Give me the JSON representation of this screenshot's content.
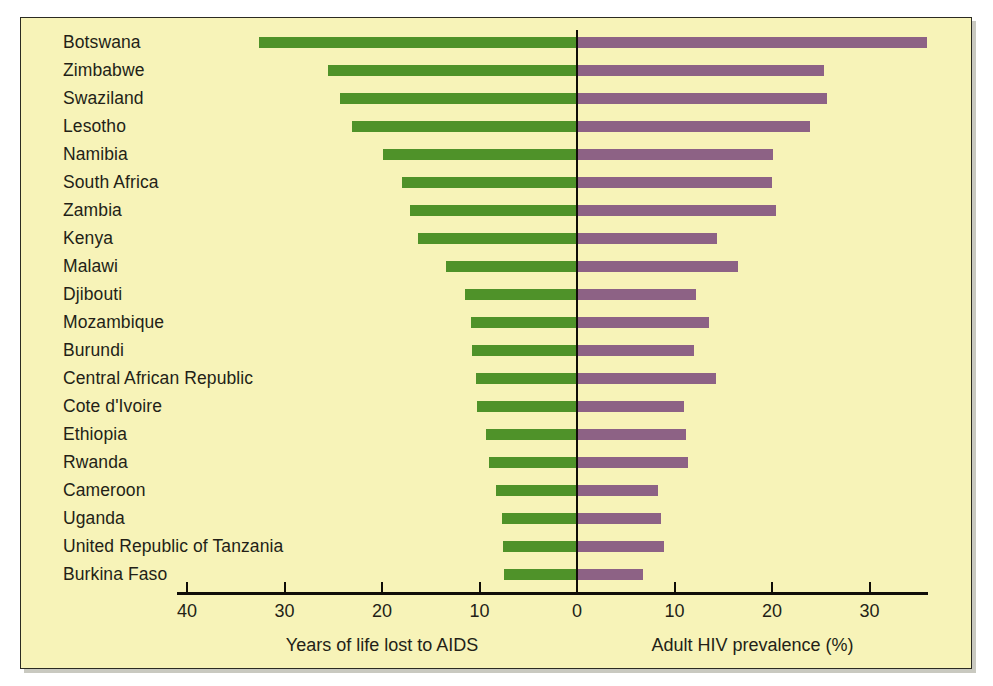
{
  "chart_data": {
    "type": "bar",
    "orientation": "horizontal",
    "style": "diverging-pyramid",
    "title": "",
    "subtitle": "",
    "categories": [
      "Botswana",
      "Zimbabwe",
      "Swaziland",
      "Lesotho",
      "Namibia",
      "South Africa",
      "Zambia",
      "Kenya",
      "Malawi",
      "Djibouti",
      "Mozambique",
      "Burundi",
      "Central African Republic",
      "Cote d'Ivoire",
      "Ethiopia",
      "Rwanda",
      "Cameroon",
      "Uganda",
      "United Republic of Tanzania",
      "Burkina Faso"
    ],
    "series": [
      {
        "name": "Years of life lost to AIDS",
        "side": "left",
        "color": "#4f9229",
        "axis_label": "Years of life lost to AIDS",
        "units": "years",
        "values": [
          32.6,
          25.5,
          24.3,
          23.1,
          19.9,
          17.9,
          17.1,
          16.3,
          13.4,
          11.5,
          10.9,
          10.8,
          10.4,
          10.3,
          9.3,
          9.0,
          8.3,
          7.7,
          7.6,
          7.5
        ]
      },
      {
        "name": "Adult HIV prevalence (%)",
        "side": "right",
        "color": "#8d6285",
        "axis_label": "Adult HIV prevalence (%)",
        "units": "%",
        "values": [
          35.9,
          25.3,
          25.6,
          23.9,
          20.1,
          20.0,
          20.4,
          14.4,
          16.5,
          12.2,
          13.5,
          12.0,
          14.3,
          11.0,
          11.2,
          11.4,
          8.3,
          8.6,
          8.9,
          6.8
        ]
      }
    ],
    "axis": {
      "left_ticks": [
        40,
        30,
        20,
        10
      ],
      "center_tick": 0,
      "right_ticks": [
        10,
        20,
        30
      ],
      "tick_labels": [
        "40",
        "30",
        "20",
        "10",
        "0",
        "10",
        "20",
        "30"
      ],
      "left_max": 40,
      "right_max": 35,
      "grid": false,
      "legend": "none"
    },
    "colors": {
      "background": "#f7f3b8",
      "page": "#ffffff",
      "frame": "#2b2b22",
      "text": "#231f17",
      "left_bar": "#4f9229",
      "right_bar": "#8d6285",
      "zero_line": "#100d08"
    }
  },
  "axis_titles": {
    "left": "Years of life lost to AIDS",
    "right": "Adult HIV prevalence (%)"
  }
}
